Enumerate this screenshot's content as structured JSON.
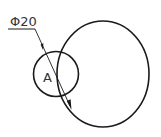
{
  "diagram": {
    "dimension_label": "Φ20",
    "point_label": "A",
    "colors": {
      "stroke": "#1a1a1a",
      "text": "#333333",
      "background": "#ffffff"
    }
  }
}
